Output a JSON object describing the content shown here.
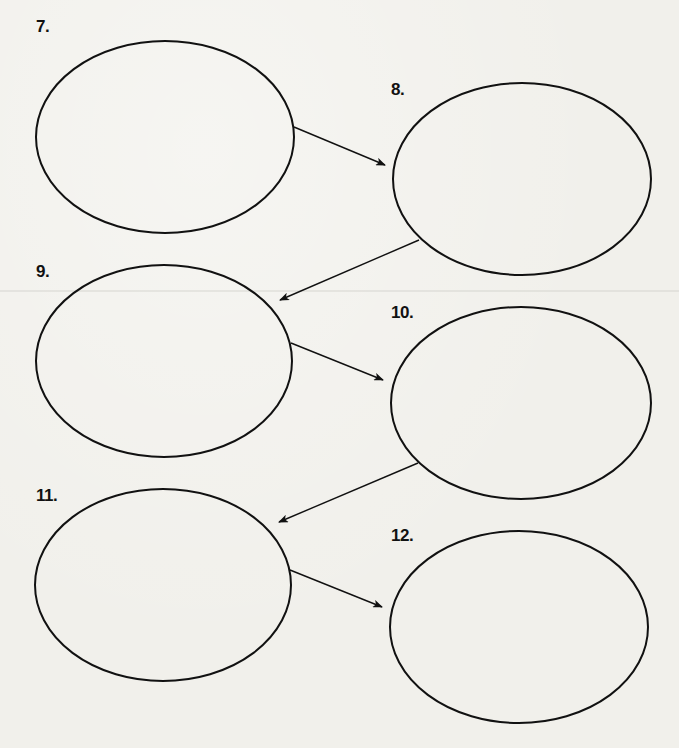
{
  "worksheet": {
    "type": "sequence-chain-organizer",
    "nodes": [
      {
        "id": 7,
        "label": "7.",
        "content": "",
        "cx": 165,
        "cy": 137,
        "rx": 129,
        "ry": 96,
        "label_x": 36,
        "label_y": 17
      },
      {
        "id": 8,
        "label": "8.",
        "content": "",
        "cx": 522,
        "cy": 179,
        "rx": 129,
        "ry": 96,
        "label_x": 391,
        "label_y": 80
      },
      {
        "id": 9,
        "label": "9.",
        "content": "",
        "cx": 164,
        "cy": 361,
        "rx": 128,
        "ry": 96,
        "label_x": 36,
        "label_y": 262
      },
      {
        "id": 10,
        "label": "10.",
        "content": "",
        "cx": 521,
        "cy": 403,
        "rx": 130,
        "ry": 96,
        "label_x": 391,
        "label_y": 303
      },
      {
        "id": 11,
        "label": "11.",
        "content": "",
        "cx": 163,
        "cy": 585,
        "rx": 128,
        "ry": 96,
        "label_x": 36,
        "label_y": 486
      },
      {
        "id": 12,
        "label": "12.",
        "content": "",
        "cx": 519,
        "cy": 627,
        "rx": 129,
        "ry": 96,
        "label_x": 391,
        "label_y": 526
      }
    ],
    "arrows": [
      {
        "from": 7,
        "to": 8,
        "x1": 294,
        "y1": 127,
        "x2": 385,
        "y2": 165
      },
      {
        "from": 8,
        "to": 9,
        "x1": 419,
        "y1": 240,
        "x2": 280,
        "y2": 300
      },
      {
        "from": 9,
        "to": 10,
        "x1": 291,
        "y1": 343,
        "x2": 383,
        "y2": 380
      },
      {
        "from": 10,
        "to": 11,
        "x1": 418,
        "y1": 463,
        "x2": 279,
        "y2": 522
      },
      {
        "from": 11,
        "to": 12,
        "x1": 290,
        "y1": 570,
        "x2": 382,
        "y2": 607
      }
    ],
    "colors": {
      "paper": "#f1f0eb",
      "stroke": "#111111"
    }
  }
}
